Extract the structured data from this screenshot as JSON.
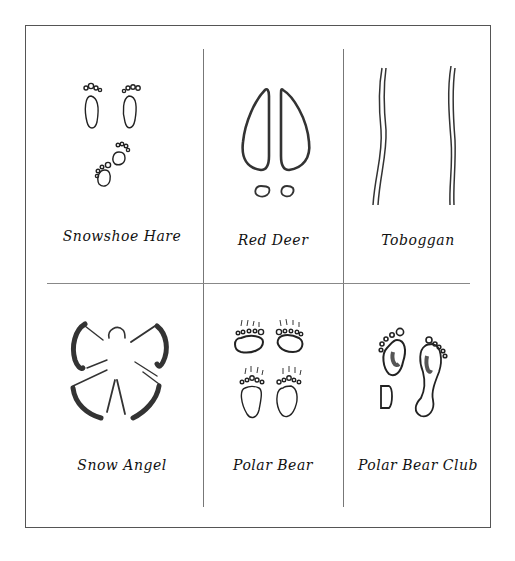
{
  "grid": {
    "rows": 2,
    "columns": 3,
    "cells": [
      {
        "label": "Snowshoe Hare",
        "icon": "hare-tracks-icon"
      },
      {
        "label": "Red Deer",
        "icon": "deer-hoof-tracks-icon"
      },
      {
        "label": "Toboggan",
        "icon": "toboggan-tracks-icon"
      },
      {
        "label": "Snow Angel",
        "icon": "snow-angel-icon"
      },
      {
        "label": "Polar Bear",
        "icon": "polar-bear-paw-tracks-icon"
      },
      {
        "label": "Polar Bear Club",
        "icon": "human-footprints-icon"
      }
    ]
  },
  "colors": {
    "ink": "#222222",
    "border": "#555555",
    "background": "#ffffff"
  }
}
